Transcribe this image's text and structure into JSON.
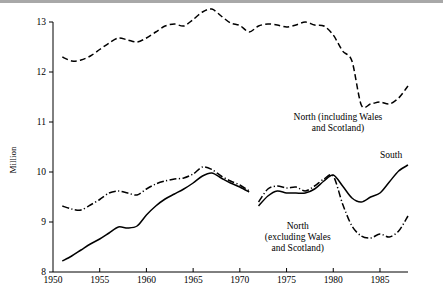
{
  "chart_data": {
    "type": "line",
    "title": "",
    "xlabel": "",
    "ylabel": "Million",
    "xlim": [
      1950,
      1988
    ],
    "ylim": [
      8,
      13
    ],
    "grid": false,
    "legend_position": "inline-annotations",
    "y_ticks": [
      8,
      9,
      10,
      11,
      12,
      13
    ],
    "y_tick_labels": [
      "8",
      "9",
      "10",
      "11",
      "12",
      "13"
    ],
    "x_ticks": [
      1950,
      1955,
      1960,
      1965,
      1970,
      1975,
      1980,
      1985
    ],
    "x_tick_labels": [
      "1950",
      "1955",
      "1960",
      "1965",
      "1970",
      "1975",
      "1980",
      "1985"
    ],
    "series": [
      {
        "name": "North (including Wales and Scotland)",
        "style": "dashed",
        "label_text": "North (including Wales\nand Scotland)",
        "label_line1": "North (including Wales",
        "label_line2": "and Scotland)",
        "label_x": 1980.5,
        "label_y": 11.05,
        "x": [
          1951,
          1952,
          1953,
          1954,
          1955,
          1956,
          1957,
          1958,
          1959,
          1960,
          1961,
          1962,
          1963,
          1964,
          1965,
          1966,
          1967,
          1968,
          1969,
          1970,
          1971,
          1972,
          1973,
          1974,
          1975,
          1976,
          1977,
          1978,
          1979,
          1980,
          1981,
          1982,
          1983,
          1984,
          1985,
          1986,
          1987,
          1988
        ],
        "values": [
          12.3,
          12.22,
          12.24,
          12.32,
          12.45,
          12.58,
          12.68,
          12.64,
          12.6,
          12.68,
          12.8,
          12.92,
          12.96,
          12.92,
          13.05,
          13.2,
          13.26,
          13.12,
          12.98,
          12.93,
          12.8,
          12.92,
          12.96,
          12.94,
          12.9,
          12.94,
          13.0,
          12.94,
          12.92,
          12.74,
          12.42,
          12.22,
          11.34,
          11.36,
          11.4,
          11.36,
          11.48,
          11.72
        ]
      },
      {
        "name": "North (excluding Wales and Scotland)",
        "style": "dash-dot",
        "label_line1": "North",
        "label_line2": "(excluding Wales",
        "label_line3": "and Scotland)",
        "label_x": 1976.2,
        "label_y": 8.86,
        "segments": [
          {
            "x": [
              1951,
              1952,
              1953,
              1954,
              1955,
              1956,
              1957,
              1958,
              1959,
              1960,
              1961,
              1962,
              1963,
              1964,
              1965,
              1966,
              1967,
              1968,
              1969,
              1970,
              1971
            ],
            "values": [
              9.32,
              9.26,
              9.24,
              9.34,
              9.45,
              9.58,
              9.62,
              9.58,
              9.54,
              9.66,
              9.76,
              9.82,
              9.86,
              9.88,
              9.96,
              10.1,
              10.05,
              9.92,
              9.82,
              9.74,
              9.62
            ]
          },
          {
            "x": [
              1972,
              1973,
              1974,
              1975,
              1976,
              1977,
              1978,
              1979,
              1980,
              1981,
              1982,
              1983,
              1984,
              1985,
              1986,
              1987,
              1988
            ],
            "values": [
              9.4,
              9.66,
              9.72,
              9.68,
              9.7,
              9.62,
              9.72,
              9.86,
              9.92,
              9.36,
              8.92,
              8.72,
              8.68,
              8.76,
              8.7,
              8.82,
              9.12
            ]
          }
        ]
      },
      {
        "name": "South",
        "style": "solid",
        "label_text": "South",
        "label_x": 1986.2,
        "label_y": 10.28,
        "segments": [
          {
            "x": [
              1951,
              1952,
              1953,
              1954,
              1955,
              1956,
              1957,
              1958,
              1959,
              1960,
              1961,
              1962,
              1963,
              1964,
              1965,
              1966,
              1967,
              1968,
              1969,
              1970,
              1971
            ],
            "values": [
              8.22,
              8.32,
              8.44,
              8.56,
              8.66,
              8.78,
              8.9,
              8.88,
              8.92,
              9.14,
              9.32,
              9.46,
              9.56,
              9.66,
              9.78,
              9.92,
              9.98,
              9.88,
              9.78,
              9.7,
              9.6
            ]
          },
          {
            "x": [
              1972,
              1973,
              1974,
              1975,
              1976,
              1977,
              1978,
              1979,
              1980,
              1981,
              1982,
              1983,
              1984,
              1985,
              1986,
              1987,
              1988
            ],
            "values": [
              9.32,
              9.52,
              9.62,
              9.58,
              9.58,
              9.58,
              9.66,
              9.82,
              9.94,
              9.72,
              9.48,
              9.4,
              9.5,
              9.58,
              9.8,
              10.02,
              10.14
            ]
          }
        ]
      }
    ]
  },
  "axis": {
    "y_title": "Million"
  }
}
